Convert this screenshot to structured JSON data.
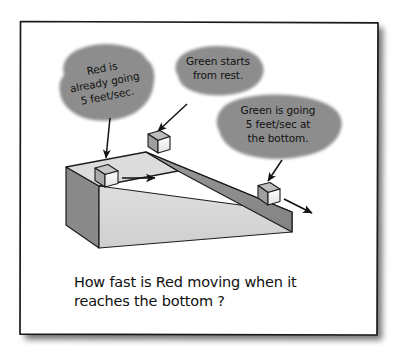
{
  "figure": {
    "title_caption": {
      "line1": "How fast is Red moving when it",
      "line2": "reaches the bottom ?"
    },
    "frame": {
      "border_color": "#1a1a1a",
      "background_color": "#ffffff",
      "shadow_color": "#9a9a9a"
    },
    "bubbles": [
      {
        "id": "red-bubble",
        "shape": "blob",
        "lines": [
          "Red is",
          "already going",
          "5 feet/sec."
        ],
        "points_to": "red-block",
        "fill_color": "#ededed",
        "stroke_color": "#222222"
      },
      {
        "id": "green-start-bubble",
        "shape": "oval",
        "lines": [
          "Green starts",
          "from rest."
        ],
        "points_to": "green-block-top",
        "fill_color": "#ebebeb",
        "stroke_color": "#222222"
      },
      {
        "id": "green-bottom-bubble",
        "shape": "oval",
        "lines": [
          "Green is going",
          "5 feet/sec at",
          "the bottom."
        ],
        "points_to": "green-block-bottom",
        "fill_color": "#ebebeb",
        "stroke_color": "#222222"
      }
    ],
    "ramp": {
      "name": "inclined-ramp",
      "top_face_color": "#d9d9d9",
      "front_face_color": "#d2d2d2",
      "side_face_color": "#8a8a8a",
      "slope_face_color": "#8f8f8f",
      "outline_color": "#1d1d1d"
    },
    "blocks": [
      {
        "id": "red-block",
        "label": "Red",
        "position": "top-platform",
        "face_color": "#f2f2f2",
        "shade_color": "#b5b5b5",
        "has_velocity_arrow": true,
        "velocity_direction": "right"
      },
      {
        "id": "green-block-top",
        "label": "Green",
        "position": "ramp-top",
        "face_color": "#f4f4f4",
        "shade_color": "#b0b0b0",
        "has_velocity_arrow": false,
        "velocity_direction": "none"
      },
      {
        "id": "green-block-bottom",
        "label": "Green",
        "position": "ramp-bottom",
        "face_color": "#f4f4f4",
        "shade_color": "#b0b0b0",
        "has_velocity_arrow": true,
        "velocity_direction": "down-right"
      }
    ]
  }
}
